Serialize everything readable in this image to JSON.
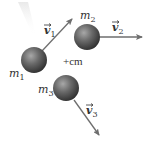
{
  "diagram": {
    "title": "",
    "center_of_mass": {
      "label": "+cm"
    },
    "masses": [
      {
        "name": "m",
        "sub": "1"
      },
      {
        "name": "m",
        "sub": "2"
      },
      {
        "name": "m",
        "sub": "3"
      }
    ],
    "velocities": [
      {
        "name": "v",
        "sub": "1"
      },
      {
        "name": "v",
        "sub": "2"
      },
      {
        "name": "v",
        "sub": "3"
      }
    ],
    "colors": {
      "sphere_dark": "#3a3a3a",
      "sphere_light": "#9a9a9a",
      "arrow": "#6e6e6e",
      "text": "#333333"
    }
  }
}
